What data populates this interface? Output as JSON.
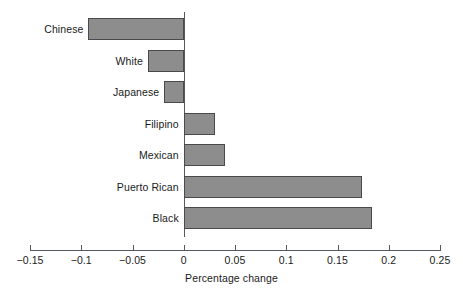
{
  "chart_data": {
    "type": "bar",
    "orientation": "horizontal",
    "title": "",
    "subtitle": "",
    "xlabel": "Percentage change",
    "ylabel": "",
    "categories": [
      "Chinese",
      "White",
      "Japanese",
      "Filipino",
      "Mexican",
      "Puerto Rican",
      "Black"
    ],
    "values": [
      -0.093,
      -0.035,
      -0.019,
      0.03,
      0.04,
      0.174,
      0.184
    ],
    "xlim": [
      -0.15,
      0.25
    ],
    "xticks": [
      -0.15,
      -0.1,
      -0.05,
      0,
      0.05,
      0.1,
      0.15,
      0.2,
      0.25
    ],
    "xtick_labels": [
      "−0.15",
      "−0.1",
      "−0.05",
      "0",
      "0.05",
      "0.1",
      "0.15",
      "0.2",
      "0.25"
    ],
    "grid": false,
    "legend": null,
    "annotations": [],
    "colors": {
      "bar_fill": "#8d8d8d",
      "bar_stroke": "#4a4a4a",
      "axis": "#555a5e",
      "text": "#1a1a1a",
      "background": "#ffffff"
    }
  }
}
